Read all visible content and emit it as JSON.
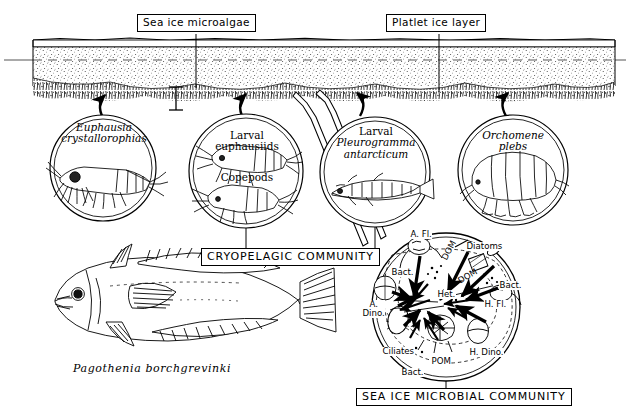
{
  "figure": {
    "ink_color": "#000000",
    "background": "#ffffff"
  },
  "ice": {
    "labels": [
      {
        "name": "sea-ice-microalgae",
        "text": "Sea ice microalgae"
      },
      {
        "name": "platlet-ice-layer",
        "text": "Platlet ice layer"
      }
    ]
  },
  "organisms": [
    {
      "id": "euphausia",
      "line1": "Euphausia",
      "line2": "crystallorophias",
      "italic1": true,
      "italic2": true,
      "extra": ""
    },
    {
      "id": "euphausiids",
      "line1": "Larval",
      "line2": "euphausiids",
      "italic1": false,
      "italic2": false,
      "extra": "Copepods"
    },
    {
      "id": "pleurogramma",
      "line1": "Larval",
      "line2": "Pleurogramma",
      "line3": "antarcticum",
      "italic1": false,
      "italic2": true,
      "extra": ""
    },
    {
      "id": "orchomene",
      "line1": "Orchomene",
      "line2": "plebs",
      "italic1": true,
      "italic2": true,
      "extra": ""
    }
  ],
  "fish": {
    "name": "Pagothenia  borchgrevinki"
  },
  "communities": [
    {
      "id": "cryopelagic",
      "text": "CRYOPELAGIC COMMUNITY"
    },
    {
      "id": "microbial",
      "text": "SEA ICE MICROBIAL COMMUNITY"
    }
  ],
  "microbial_labels": [
    {
      "id": "afl",
      "text": "A. Fl."
    },
    {
      "id": "diatoms",
      "text": "Diatoms"
    },
    {
      "id": "bact-top",
      "text": "Bact."
    },
    {
      "id": "dom-1",
      "text": "DOM"
    },
    {
      "id": "dom-2",
      "text": "DOM"
    },
    {
      "id": "bact-right",
      "text": "Bact."
    },
    {
      "id": "het",
      "text": "Het."
    },
    {
      "id": "hfl",
      "text": "H. Fl."
    },
    {
      "id": "adino",
      "text": "A.",
      "text2": "Dino."
    },
    {
      "id": "ciliates",
      "text": "Ciliates"
    },
    {
      "id": "pom",
      "text": "POM"
    },
    {
      "id": "hdino",
      "text": "H. Dino."
    },
    {
      "id": "bact-bottom",
      "text": "Bact."
    }
  ]
}
